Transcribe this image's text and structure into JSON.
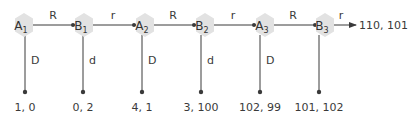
{
  "diagram": {
    "type": "extensive-form game tree (centipede)",
    "colors": {
      "node_fill": "#e2e2e2",
      "line": "#3a3a3a",
      "text": "#333333"
    },
    "nodes": [
      {
        "id": "A1",
        "player": "A",
        "sub": "1"
      },
      {
        "id": "B1",
        "player": "B",
        "sub": "1"
      },
      {
        "id": "A2",
        "player": "A",
        "sub": "2"
      },
      {
        "id": "B2",
        "player": "B",
        "sub": "2"
      },
      {
        "id": "A3",
        "player": "A",
        "sub": "3"
      },
      {
        "id": "B3",
        "player": "B",
        "sub": "3"
      }
    ],
    "continue_edges": [
      {
        "from": "A1",
        "to": "B1",
        "label": "R"
      },
      {
        "from": "B1",
        "to": "A2",
        "label": "r"
      },
      {
        "from": "A2",
        "to": "B2",
        "label": "R"
      },
      {
        "from": "B2",
        "to": "A3",
        "label": "r"
      },
      {
        "from": "A3",
        "to": "B3",
        "label": "R"
      },
      {
        "from": "B3",
        "to": "end",
        "label": "r"
      }
    ],
    "stop_edges": [
      {
        "from": "A1",
        "label": "D",
        "payoff": "1, 0"
      },
      {
        "from": "B1",
        "label": "d",
        "payoff": "0, 2"
      },
      {
        "from": "A2",
        "label": "D",
        "payoff": "4, 1"
      },
      {
        "from": "B2",
        "label": "d",
        "payoff": "3, 100"
      },
      {
        "from": "A3",
        "label": "D",
        "payoff": "102, 99"
      },
      {
        "from": "B3",
        "label": "d",
        "payoff": "101, 102"
      }
    ],
    "final_payoff": "110, 101"
  }
}
